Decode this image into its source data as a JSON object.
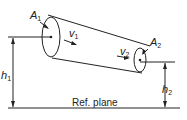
{
  "labels": {
    "A1": {
      "sym": "A",
      "sub": "1"
    },
    "A2": {
      "sym": "A",
      "sub": "2"
    },
    "v1": {
      "sym": "v",
      "sub": "1"
    },
    "v2": {
      "sym": "v",
      "sub": "2"
    },
    "h1": {
      "sym": "h",
      "sub": "1"
    },
    "h2": {
      "sym": "h",
      "sub": "2"
    },
    "ref_plane": "Ref. plane"
  },
  "colors": {
    "stroke": "#222222",
    "background": "#ffffff"
  }
}
